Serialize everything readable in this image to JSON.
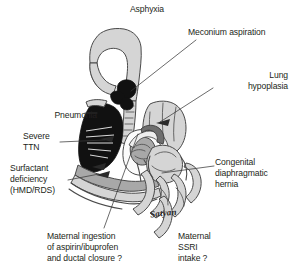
{
  "figure": {
    "title": "Asphyxia",
    "background_color": "#ffffff",
    "text_color": "#231f20",
    "signature": "Satyan"
  },
  "labels": {
    "asphyxia": "Asphyxia",
    "meconium_aspiration": "Meconium aspiration",
    "lung_hypoplasia": "Lung\nhypoplasia",
    "pneumonia": "Pneumonia",
    "severe_ttn": "Severe\nTTN",
    "surfactant_deficiency": "Surfactant\ndeficiency\n(HMD/RDS)",
    "congenital_diaphragmatic_hernia": "Congenital\ndiaphragmatic\nhernia",
    "maternal_ingestion": "Maternal ingestion\nof aspirin/ibuprofen\nand ductal closure ?",
    "maternal_ssri": "Maternal\nSSRI\nintake ?"
  },
  "anatomy": {
    "parts": [
      "pharynx-airway",
      "trachea",
      "meconium-plug",
      "consolidated-left-lung",
      "hypoplastic-right-lung",
      "heart",
      "great-vessels",
      "ductus-arteriosus",
      "diaphragm",
      "herniated-bowel-loops"
    ],
    "colors": {
      "outline": "#4a4a4a",
      "light_gray": "#d5d5d5",
      "mid_gray": "#a8a8a8",
      "dark_gray": "#6e6e6e",
      "black_fill": "#111111",
      "white_fill": "#fbfbfb",
      "leader_line": "#3a3a3a"
    }
  }
}
